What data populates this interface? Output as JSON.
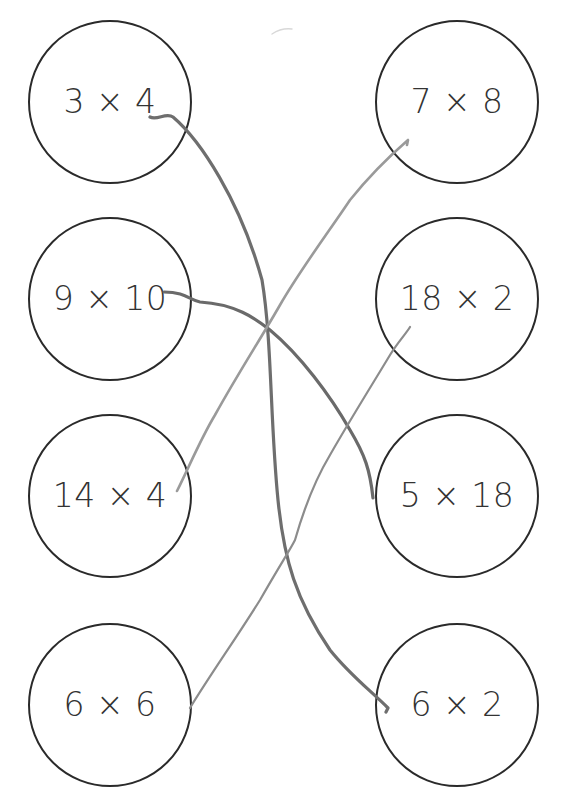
{
  "worksheet": {
    "left_column": [
      {
        "id": "L1",
        "label": "3 × 4",
        "cx": 110,
        "cy": 102,
        "r": 82
      },
      {
        "id": "L2",
        "label": "9 × 10",
        "cx": 110,
        "cy": 299,
        "r": 82
      },
      {
        "id": "L3",
        "label": "14 × 4",
        "cx": 110,
        "cy": 496,
        "r": 82
      },
      {
        "id": "L4",
        "label": "6 × 6",
        "cx": 110,
        "cy": 705,
        "r": 82
      }
    ],
    "right_column": [
      {
        "id": "R1",
        "label": "7 × 8",
        "cx": 457,
        "cy": 102,
        "r": 82
      },
      {
        "id": "R2",
        "label": "18 × 2",
        "cx": 457,
        "cy": 299,
        "r": 82
      },
      {
        "id": "R3",
        "label": "5 × 18",
        "cx": 457,
        "cy": 496,
        "r": 82
      },
      {
        "id": "R4",
        "label": "6 × 2",
        "cx": 457,
        "cy": 705,
        "r": 82
      }
    ],
    "connections": [
      {
        "from": "3 × 4",
        "to": "6 × 2",
        "color": "#6e6e6e",
        "width": 3.2,
        "path": "M150,117 C157,121 166,112 173,117 C200,140 240,200 262,280 C272,340 270,420 278,500 C284,560 296,600 330,650 C350,675 370,690 388,708 L386,712"
      },
      {
        "from": "9 × 10",
        "to": "5 × 18",
        "color": "#6a6a6a",
        "width": 3.2,
        "path": "M164,292 C185,292 190,300 200,302 C235,304 255,318 270,330 C300,355 330,395 350,430 C365,455 370,470 373,498"
      },
      {
        "from": "14 × 4",
        "to": "7 × 8",
        "color": "#9a9a9a",
        "width": 2.6,
        "path": "M177,491 C190,465 200,440 215,415 C240,370 260,340 280,305 C300,270 330,230 350,200 C370,175 385,160 408,140 L407,145"
      },
      {
        "from": "6 × 6",
        "to": "18 × 2",
        "color": "#8c8c8c",
        "width": 2.2,
        "path": "M190,708 C210,675 235,640 260,600 C280,565 290,550 295,540 C305,505 315,480 330,455 C350,420 375,380 390,355 C398,342 405,335 410,327"
      }
    ]
  }
}
